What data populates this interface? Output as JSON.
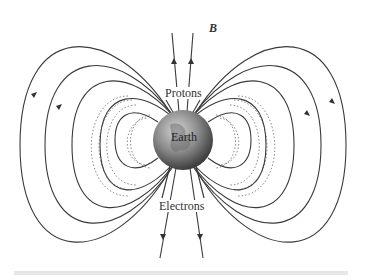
{
  "figure": {
    "labels": {
      "field": "B",
      "field_vector_marker": "→",
      "top_particles": "Protons",
      "bottom_particles": "Electrons",
      "planet": "Earth"
    },
    "colors": {
      "field_lines": "#333333",
      "earth_light": "#bdbdbd",
      "earth_dark": "#4a4a4a",
      "footer_bar": "#e6e6e6"
    }
  }
}
